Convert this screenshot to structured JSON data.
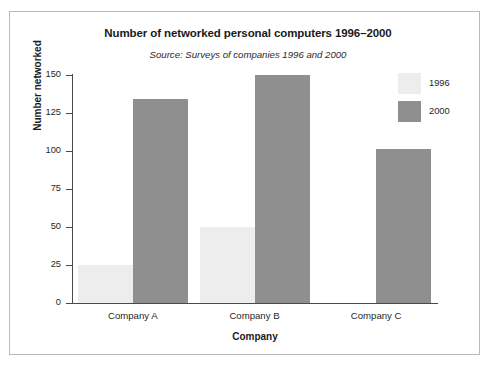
{
  "chart_data": {
    "type": "bar",
    "title": "Number of networked personal computers 1996–2000",
    "subtitle": "Source: Surveys of companies 1996 and 2000",
    "xlabel": "Company",
    "ylabel": "Number networked",
    "categories": [
      "Company A",
      "Company B",
      "Company C"
    ],
    "series": [
      {
        "name": "1996",
        "color": "#ededed",
        "values": [
          25,
          50,
          null
        ]
      },
      {
        "name": "2000",
        "color": "#8f8f8f",
        "values": [
          134,
          150,
          101
        ]
      }
    ],
    "ylim": [
      0,
      150
    ],
    "yticks": [
      0,
      25,
      50,
      75,
      100,
      125,
      150
    ],
    "ytick_labels": [
      "0",
      "25",
      "50",
      "75",
      "100",
      "125",
      "150"
    ],
    "grid": false,
    "legend_position": "top-right",
    "legend_entries": [
      "1996",
      "2000"
    ]
  }
}
